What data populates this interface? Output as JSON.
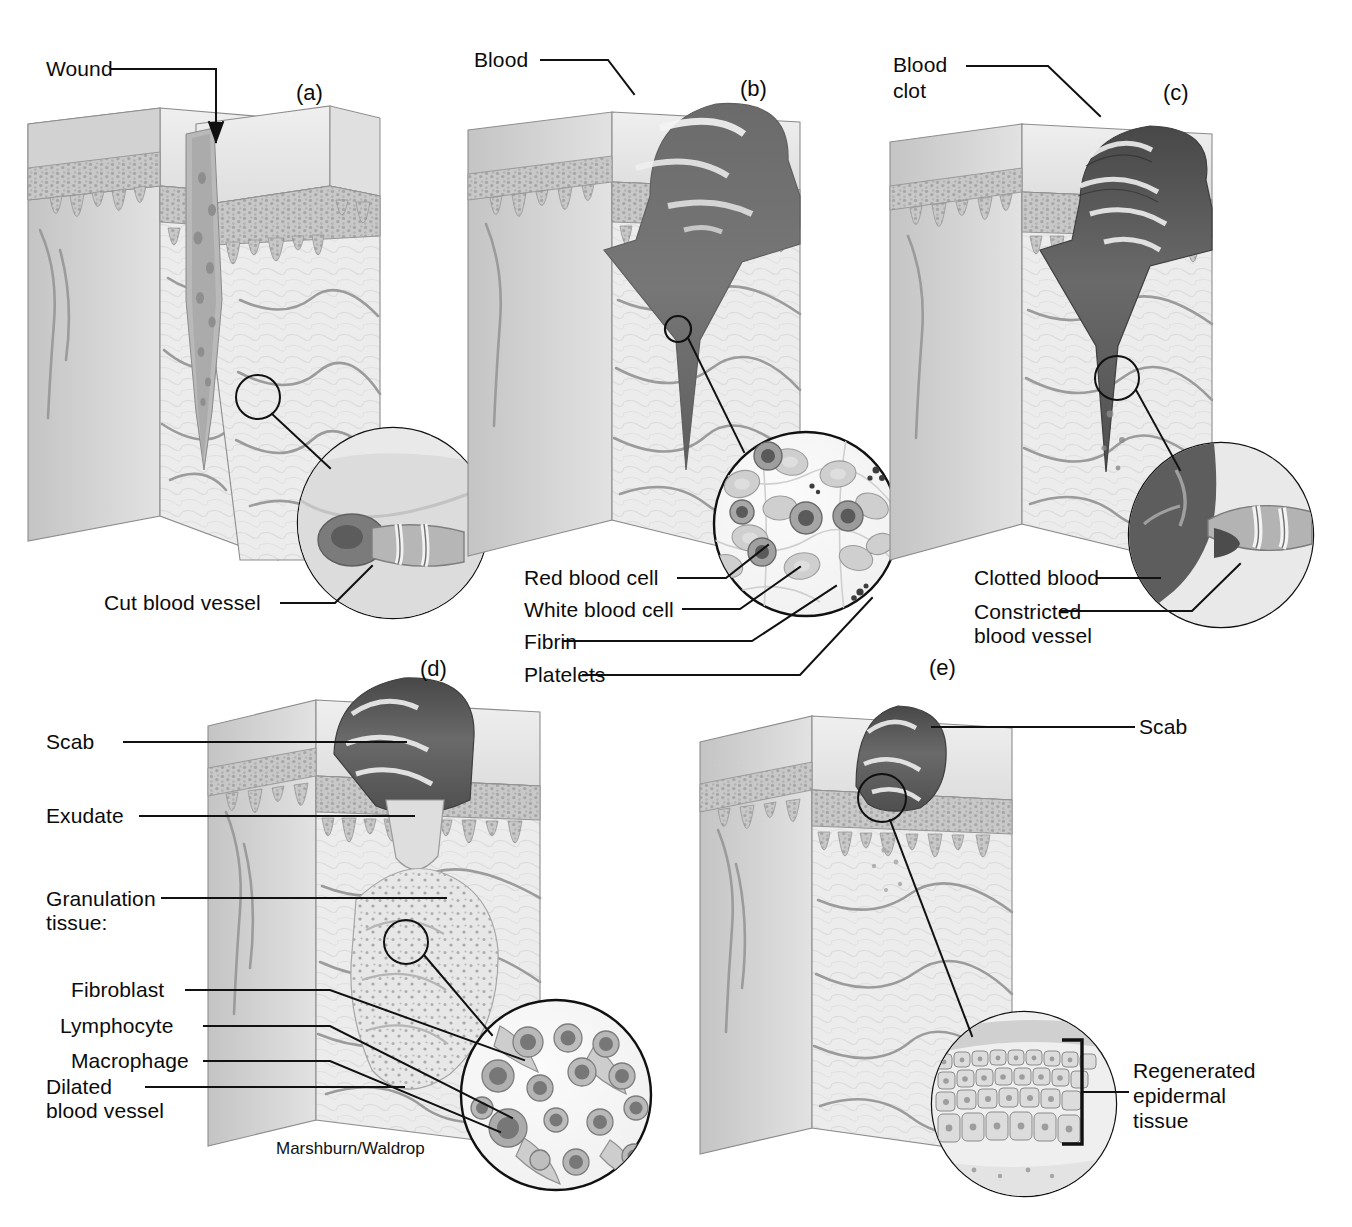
{
  "figure": {
    "credit": "Marshburn/Waldrop",
    "panel_letters": {
      "a": "(a)",
      "b": "(b)",
      "c": "(c)",
      "d": "(d)",
      "e": "(e)"
    }
  },
  "panels": [
    {
      "id": "a",
      "letter": "(a)",
      "labels": [
        {
          "key": "wound",
          "text": "Wound"
        },
        {
          "key": "cut_blood_vessel",
          "text": "Cut blood vessel"
        }
      ]
    },
    {
      "id": "b",
      "letter": "(b)",
      "labels": [
        {
          "key": "blood",
          "text": "Blood"
        },
        {
          "key": "red_blood_cell",
          "text": "Red blood cell"
        },
        {
          "key": "white_blood_cell",
          "text": "White blood cell"
        },
        {
          "key": "fibrin",
          "text": "Fibrin"
        },
        {
          "key": "platelets",
          "text": "Platelets"
        }
      ]
    },
    {
      "id": "c",
      "letter": "(c)",
      "labels": [
        {
          "key": "blood_clot_line1",
          "text": "Blood"
        },
        {
          "key": "blood_clot_line2",
          "text": "clot"
        },
        {
          "key": "clotted_blood",
          "text": "Clotted blood"
        },
        {
          "key": "constricted_line1",
          "text": "Constricted"
        },
        {
          "key": "constricted_line2",
          "text": "blood vessel"
        }
      ]
    },
    {
      "id": "d",
      "letter": "(d)",
      "labels": [
        {
          "key": "scab",
          "text": "Scab"
        },
        {
          "key": "exudate",
          "text": "Exudate"
        },
        {
          "key": "granulation_line1",
          "text": "Granulation"
        },
        {
          "key": "granulation_line2",
          "text": "tissue:"
        },
        {
          "key": "fibroblast",
          "text": "Fibroblast"
        },
        {
          "key": "lymphocyte",
          "text": "Lymphocyte"
        },
        {
          "key": "macrophage",
          "text": "Macrophage"
        },
        {
          "key": "dilated_line1",
          "text": "Dilated"
        },
        {
          "key": "dilated_line2",
          "text": "blood vessel"
        }
      ]
    },
    {
      "id": "e",
      "letter": "(e)",
      "labels": [
        {
          "key": "scab",
          "text": "Scab"
        },
        {
          "key": "regenerated_line1",
          "text": "Regenerated"
        },
        {
          "key": "regenerated_line2",
          "text": "epidermal"
        },
        {
          "key": "regenerated_line3",
          "text": "tissue"
        }
      ]
    }
  ],
  "colors": {
    "ink": "#0b0b0b",
    "leader": "#111111",
    "epidermis": "#b9b9b9",
    "dermis_light": "#ececec",
    "dermis_mid": "#d9d9d9",
    "block_top": "#e8e8e8",
    "block_side": "#cfcfcf",
    "blood_dark": "#6e6e6e",
    "blood_darker": "#4a4a4a",
    "scab_dark": "#555555",
    "vessel": "#9a9a9a",
    "background": "#ffffff"
  }
}
